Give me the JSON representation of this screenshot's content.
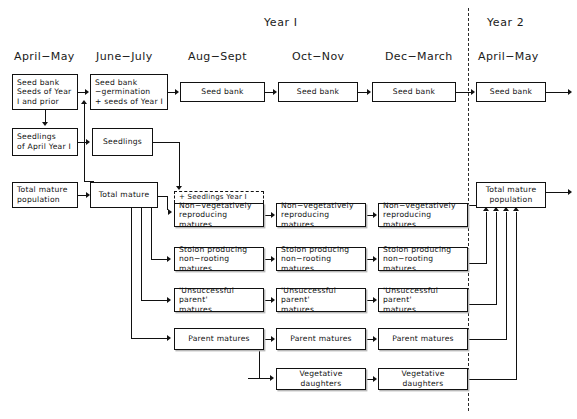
{
  "figure": {
    "years": [
      {
        "label": "Year I",
        "x": 264,
        "y": 16
      },
      {
        "label": "Year 2",
        "x": 487,
        "y": 16
      }
    ],
    "columns": [
      {
        "id": "april-may-1",
        "label": "April−May",
        "x": 14,
        "y": 50
      },
      {
        "id": "june-july",
        "label": "June−July",
        "x": 96,
        "y": 50
      },
      {
        "id": "aug-sept",
        "label": "Aug−Sept",
        "x": 188,
        "y": 50
      },
      {
        "id": "oct-nov",
        "label": "Oct−Nov",
        "x": 292,
        "y": 50
      },
      {
        "id": "dec-march",
        "label": "Dec−March",
        "x": 385,
        "y": 50
      },
      {
        "id": "april-may-2",
        "label": "April−May",
        "x": 478,
        "y": 50
      }
    ],
    "year_dividers": [
      {
        "x": 468,
        "y": 8,
        "height": 403
      }
    ],
    "nodes": [
      {
        "id": "seedbank-apr1",
        "label": "Seed bank\nSeeds of Year\nI and prior",
        "x": 12,
        "y": 74,
        "w": 66,
        "h": 36,
        "align": "lft",
        "shadow": false,
        "dashed": false
      },
      {
        "id": "seedbank-jun",
        "label": "Seed bank\n−germination\n+ seeds of Year I",
        "x": 90,
        "y": 74,
        "w": 78,
        "h": 36,
        "align": "lft",
        "shadow": false,
        "dashed": false
      },
      {
        "id": "seedbank-aug",
        "label": "Seed bank",
        "x": 180,
        "y": 82,
        "w": 85,
        "h": 20,
        "align": "ctr",
        "shadow": false,
        "dashed": false
      },
      {
        "id": "seedbank-oct",
        "label": "Seed bank",
        "x": 278,
        "y": 82,
        "w": 80,
        "h": 20,
        "align": "ctr",
        "shadow": false,
        "dashed": false
      },
      {
        "id": "seedbank-dec",
        "label": "Seed bank",
        "x": 372,
        "y": 82,
        "w": 84,
        "h": 20,
        "align": "ctr",
        "shadow": false,
        "dashed": false
      },
      {
        "id": "seedbank-apr2",
        "label": "Seed bank",
        "x": 476,
        "y": 82,
        "w": 70,
        "h": 20,
        "align": "ctr",
        "shadow": false,
        "dashed": false
      },
      {
        "id": "seedlings-apr",
        "label": "Seedlings\nof April Year I",
        "x": 12,
        "y": 128,
        "w": 66,
        "h": 28,
        "align": "lft",
        "shadow": false,
        "dashed": false
      },
      {
        "id": "seedlings-jun",
        "label": "Seedlings",
        "x": 92,
        "y": 128,
        "w": 61,
        "h": 28,
        "align": "ctr",
        "shadow": false,
        "dashed": false
      },
      {
        "id": "totmat-pop-apr",
        "label": "Total mature\npopulation",
        "x": 12,
        "y": 182,
        "w": 66,
        "h": 26,
        "align": "lft",
        "shadow": false,
        "dashed": false
      },
      {
        "id": "totmat-jun",
        "label": "Total mature",
        "x": 90,
        "y": 182,
        "w": 68,
        "h": 26,
        "align": "ctr",
        "shadow": false,
        "dashed": false
      },
      {
        "id": "seedlings-tag",
        "label": "+ Seedlings Year I",
        "x": 174,
        "y": 191,
        "w": 90,
        "h": 12,
        "align": "lft",
        "shadow": false,
        "dashed": true
      },
      {
        "id": "nonveg-aug",
        "label": "Non−vegetatively\nreproducing matures",
        "x": 174,
        "y": 203,
        "w": 90,
        "h": 24,
        "align": "lft",
        "shadow": true,
        "dashed": false
      },
      {
        "id": "nonveg-oct",
        "label": "Non−vegetatively\nreproducing matures",
        "x": 276,
        "y": 203,
        "w": 90,
        "h": 24,
        "align": "lft",
        "shadow": true,
        "dashed": false
      },
      {
        "id": "nonveg-dec",
        "label": "Non−vegetatively\nreproducing matures",
        "x": 378,
        "y": 203,
        "w": 90,
        "h": 24,
        "align": "lft",
        "shadow": true,
        "dashed": false
      },
      {
        "id": "stolon-aug",
        "label": "Stolon producing\nnon−rooting matures",
        "x": 174,
        "y": 247,
        "w": 90,
        "h": 24,
        "align": "lft",
        "shadow": true,
        "dashed": false
      },
      {
        "id": "stolon-oct",
        "label": "Stolon producing\nnon−rooting matures",
        "x": 276,
        "y": 247,
        "w": 90,
        "h": 24,
        "align": "lft",
        "shadow": true,
        "dashed": false
      },
      {
        "id": "stolon-dec",
        "label": "Stolon producing\nnon−rooting matures",
        "x": 378,
        "y": 247,
        "w": 90,
        "h": 24,
        "align": "lft",
        "shadow": true,
        "dashed": false
      },
      {
        "id": "unsucc-aug",
        "label": "'Unsuccessful parent'\nmatures",
        "x": 174,
        "y": 288,
        "w": 90,
        "h": 24,
        "align": "lft",
        "shadow": true,
        "dashed": false
      },
      {
        "id": "unsucc-oct",
        "label": "'Unsuccessful parent'\nmatures",
        "x": 276,
        "y": 288,
        "w": 90,
        "h": 24,
        "align": "lft",
        "shadow": true,
        "dashed": false
      },
      {
        "id": "unsucc-dec",
        "label": "'Unsuccessful parent'\nmatures",
        "x": 378,
        "y": 288,
        "w": 90,
        "h": 24,
        "align": "lft",
        "shadow": true,
        "dashed": false
      },
      {
        "id": "parent-aug",
        "label": "Parent matures",
        "x": 174,
        "y": 328,
        "w": 90,
        "h": 22,
        "align": "ctr",
        "shadow": true,
        "dashed": false
      },
      {
        "id": "parent-oct",
        "label": "Parent matures",
        "x": 276,
        "y": 328,
        "w": 90,
        "h": 22,
        "align": "ctr",
        "shadow": true,
        "dashed": false
      },
      {
        "id": "parent-dec",
        "label": "Parent matures",
        "x": 378,
        "y": 328,
        "w": 90,
        "h": 22,
        "align": "ctr",
        "shadow": true,
        "dashed": false
      },
      {
        "id": "vegdau-oct",
        "label": "Vegetative daughters",
        "x": 276,
        "y": 368,
        "w": 90,
        "h": 22,
        "align": "ctr",
        "shadow": true,
        "dashed": false
      },
      {
        "id": "vegdau-dec",
        "label": "Vegetative daughters",
        "x": 378,
        "y": 368,
        "w": 90,
        "h": 22,
        "align": "ctr",
        "shadow": true,
        "dashed": false
      },
      {
        "id": "totmat-pop-apr2",
        "label": "Total mature\npopulation",
        "x": 476,
        "y": 182,
        "w": 70,
        "h": 26,
        "align": "ctr",
        "shadow": false,
        "dashed": false
      }
    ]
  }
}
